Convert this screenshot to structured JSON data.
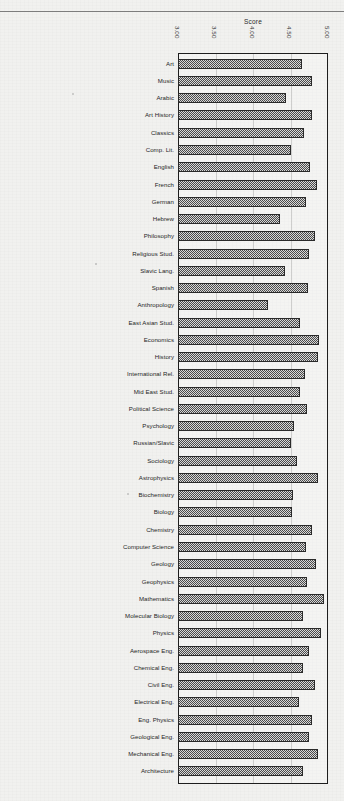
{
  "chart_data": {
    "type": "bar",
    "orientation": "horizontal",
    "title": "",
    "xlabel": "Score",
    "ylabel": "",
    "xlim": [
      3.0,
      5.0
    ],
    "xticks": [
      "3.00",
      "3.50",
      "4.00",
      "4.50",
      "5.00"
    ],
    "xtick_values": [
      3.0,
      3.5,
      4.0,
      4.5,
      5.0
    ],
    "grid": true,
    "legend": "none",
    "categories": [
      "Art",
      "Music",
      "Arabic",
      "Art History",
      "Classics",
      "Comp. Lit.",
      "English",
      "French",
      "German",
      "Hebrew",
      "Philosophy",
      "Religious Stud.",
      "Slavic Lang.",
      "Spanish",
      "Anthropology",
      "East Asian Stud.",
      "Economics",
      "History",
      "International Rel.",
      "Mid East Stud.",
      "Political Science",
      "Psychology",
      "Russian/Slavic",
      "Sociology",
      "Astrophysics",
      "Biochemistry",
      "Biology",
      "Chemistry",
      "Computer Science",
      "Geology",
      "Geophysics",
      "Mathematics",
      "Molecular Biology",
      "Physics",
      "Aerospace Eng.",
      "Chemical Eng.",
      "Civil Eng.",
      "Electrical Eng.",
      "Eng. Physics",
      "Geological Eng.",
      "Mechanical Eng.",
      "Architecture"
    ],
    "values": [
      4.65,
      4.78,
      4.44,
      4.79,
      4.68,
      4.5,
      4.76,
      4.85,
      4.71,
      4.36,
      4.82,
      4.74,
      4.43,
      4.73,
      4.2,
      4.63,
      4.88,
      4.86,
      4.69,
      4.62,
      4.72,
      4.55,
      4.5,
      4.58,
      4.87,
      4.53,
      4.52,
      4.79,
      4.7,
      4.84,
      4.72,
      4.95,
      4.66,
      4.9,
      4.75,
      4.66,
      4.83,
      4.61,
      4.78,
      4.74,
      4.87,
      4.67
    ]
  },
  "axis": {
    "x_title": "Score",
    "tick_labels": [
      "3.00",
      "3.50",
      "4.00",
      "4.50",
      "5.00"
    ]
  }
}
